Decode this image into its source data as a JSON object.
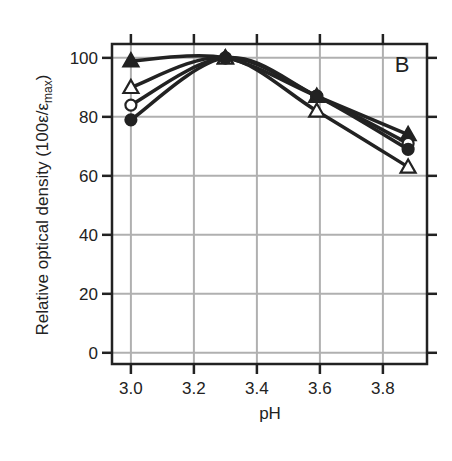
{
  "chart_data": {
    "type": "line",
    "title": "",
    "panel_label": "B",
    "xlabel": "pH",
    "ylabel": "Relative optical density (100ε/ε",
    "ylabel_sub": "max",
    "ylabel_close": ")",
    "xlim": [
      2.94,
      3.94
    ],
    "ylim": [
      -3.8,
      104.7
    ],
    "xticks": [
      3.0,
      3.2,
      3.4,
      3.6,
      3.8
    ],
    "xtick_labels": [
      "3.0",
      "3.2",
      "3.4",
      "3.6",
      "3.8"
    ],
    "yticks": [
      0,
      20,
      40,
      60,
      80,
      100
    ],
    "ytick_labels": [
      "0",
      "20",
      "40",
      "60",
      "80",
      "100"
    ],
    "grid": true,
    "legend": null,
    "x": [
      3.0,
      3.3,
      3.59,
      3.88
    ],
    "series": [
      {
        "name": "filled triangle",
        "marker": "triangle-filled",
        "values": [
          99,
          100,
          87,
          74
        ]
      },
      {
        "name": "open triangle",
        "marker": "triangle-open",
        "values": [
          90,
          100,
          82,
          63
        ]
      },
      {
        "name": "open circle",
        "marker": "circle-open",
        "values": [
          84,
          100,
          87,
          71
        ]
      },
      {
        "name": "filled circle",
        "marker": "circle-filled",
        "values": [
          79,
          100,
          87,
          69
        ]
      }
    ]
  },
  "colors": {
    "line": "#222222",
    "grid": "#b0b0b0",
    "background": "#ffffff"
  }
}
